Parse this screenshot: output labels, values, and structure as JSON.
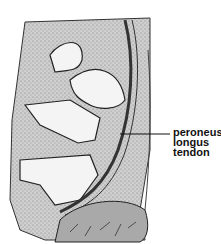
{
  "figure": {
    "labels": [
      {
        "lines": [
          "peroneus",
          "longus",
          "tendon"
        ]
      }
    ],
    "colors": {
      "outline": "#222222",
      "stipple": "#bdbdbd",
      "bone": "#f4f4f4",
      "muscle": "#a9a9a9",
      "background": "#ffffff"
    }
  }
}
